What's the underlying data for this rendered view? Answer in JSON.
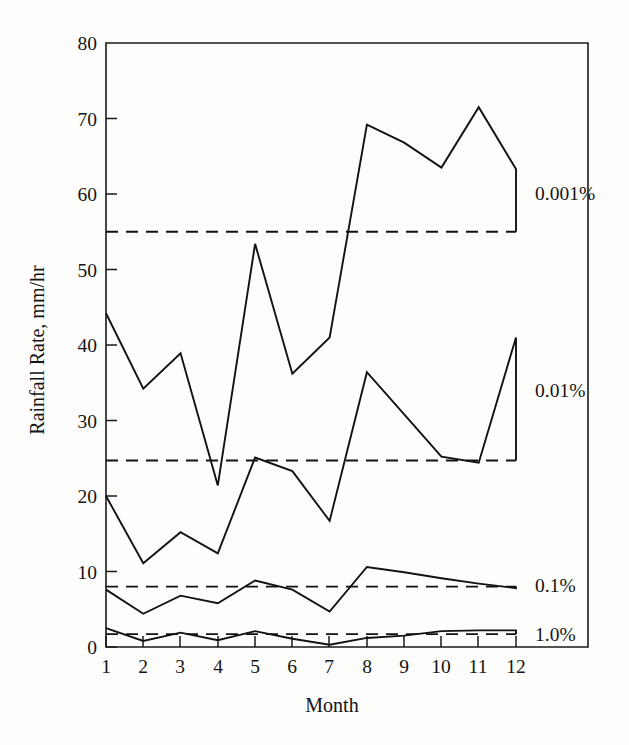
{
  "chart_data": {
    "type": "line",
    "title": "",
    "xlabel": "Month",
    "ylabel": "Rainfall Rate, mm/hr",
    "xlim": [
      1,
      12
    ],
    "ylim": [
      0,
      80
    ],
    "grid": false,
    "legend_position": "right-inline",
    "x_tick_labels": [
      "1",
      "2",
      "3",
      "4",
      "5",
      "6",
      "7",
      "8",
      "9",
      "10",
      "11",
      "12"
    ],
    "y_tick_labels": [
      "0",
      "10",
      "20",
      "30",
      "40",
      "50",
      "60",
      "70",
      "80"
    ],
    "x": [
      1,
      2,
      3,
      4,
      5,
      6,
      7,
      8,
      9,
      10,
      11,
      12
    ],
    "series": [
      {
        "name": "0.001%",
        "label": "0.001%",
        "style": "solid",
        "values": [
          44.2,
          34.2,
          38.9,
          21.4,
          53.4,
          36.2,
          41.0,
          69.2,
          66.8,
          63.5,
          71.5,
          63.3
        ],
        "annual_mean": 55.0,
        "end_drop_to": 55.0
      },
      {
        "name": "0.01%",
        "label": "0.01%",
        "style": "solid",
        "values": [
          20.0,
          11.1,
          15.2,
          12.4,
          25.1,
          23.3,
          16.7,
          36.4,
          30.8,
          25.2,
          24.4,
          41.0
        ],
        "annual_mean": 24.7,
        "end_drop_to": 24.7
      },
      {
        "name": "0.1%",
        "label": "0.1%",
        "style": "solid",
        "values": [
          7.6,
          4.4,
          6.8,
          5.8,
          8.8,
          7.6,
          4.7,
          10.6,
          9.9,
          9.1,
          8.4,
          7.8
        ],
        "annual_mean": 8.0,
        "end_drop_to": 8.0
      },
      {
        "name": "1.0%",
        "label": "1.0%",
        "style": "solid",
        "values": [
          2.5,
          0.8,
          1.9,
          0.9,
          2.1,
          1.1,
          0.3,
          1.2,
          1.5,
          2.1,
          2.2,
          2.2
        ],
        "annual_mean": 1.7,
        "end_drop_to": 1.7
      }
    ],
    "threshold_lines": [
      {
        "name": "0.001%",
        "value": 55.0
      },
      {
        "name": "0.01%",
        "value": 24.7
      },
      {
        "name": "0.1%",
        "value": 8.0
      },
      {
        "name": "1.0%",
        "value": 1.7
      }
    ],
    "series_labels": [
      {
        "text": "0.001%",
        "y_value": 61.0
      },
      {
        "text": "0.01%",
        "y_value": 33.0
      },
      {
        "text": "0.1%",
        "y_value": 8.6
      },
      {
        "text": "1.0%",
        "y_value": 2.2
      }
    ]
  }
}
